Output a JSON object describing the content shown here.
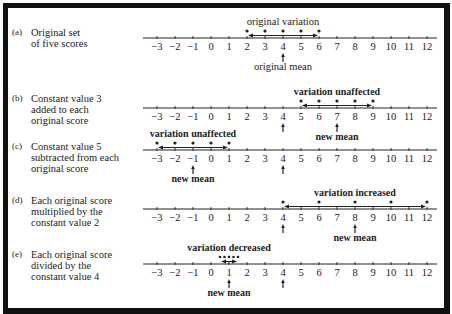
{
  "axis": {
    "ticks": [
      -3,
      -2,
      -1,
      0,
      1,
      2,
      3,
      4,
      5,
      6,
      7,
      8,
      9,
      10,
      11,
      12
    ],
    "tick_labels": [
      "−3",
      "−2",
      "−1",
      "0",
      "1",
      "2",
      "3",
      "4",
      "5",
      "6",
      "7",
      "8",
      "9",
      "10",
      "11",
      "12"
    ]
  },
  "panels": [
    {
      "tag": "(a)",
      "description_lines": [
        "Original set",
        "of five scores"
      ],
      "scores": [
        2,
        3,
        4,
        5,
        6
      ],
      "top_annotation": "original  variation",
      "mean": 4,
      "mean_label": "original mean",
      "original_mean_marker": null
    },
    {
      "tag": "(b)",
      "description_lines": [
        "Constant value 3",
        "added to each",
        "original score"
      ],
      "scores": [
        5,
        6,
        7,
        8,
        9
      ],
      "top_annotation": "variation  unaffected",
      "mean": 7,
      "mean_label": "new  mean",
      "original_mean_marker": 4
    },
    {
      "tag": "(c)",
      "description_lines": [
        "Constant value 5",
        "subtracted from each",
        "original score"
      ],
      "scores": [
        -3,
        -2,
        -1,
        0,
        1
      ],
      "top_annotation": "variation  unaffected",
      "mean": -1,
      "mean_label": "new  mean",
      "original_mean_marker": 4
    },
    {
      "tag": "(d)",
      "description_lines": [
        "Each original score",
        "multiplied by the",
        "constant value 2"
      ],
      "scores": [
        4,
        6,
        8,
        10,
        12
      ],
      "top_annotation": "variation  increased",
      "mean": 8,
      "mean_label": "new  mean",
      "original_mean_marker": 4
    },
    {
      "tag": "(e)",
      "description_lines": [
        "Each original score",
        "divided by the",
        "constant value 4"
      ],
      "scores": [
        0.5,
        0.75,
        1,
        1.25,
        1.5
      ],
      "top_annotation": "variation  decreased",
      "mean": 1,
      "mean_label": "new  mean",
      "original_mean_marker": 4
    }
  ],
  "colors": {
    "ink": "#222222",
    "frame": "#111111",
    "background": "#ffffff"
  }
}
